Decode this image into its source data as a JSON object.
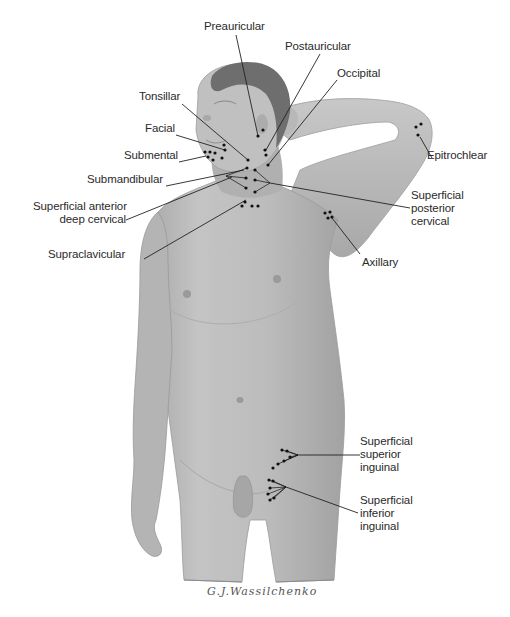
{
  "figure": {
    "signature": "G.J.Wassilchenko",
    "colors": {
      "skin": "#bdbdbd",
      "skin_shadow": "#9a9a9a",
      "hair": "#6e6e6e",
      "leader": "#222222",
      "node": "#111111",
      "background": "#ffffff"
    }
  },
  "labels": [
    {
      "id": "preauricular",
      "text": "Preauricular",
      "x": 204,
      "y": 27
    },
    {
      "id": "postauricular",
      "text": "Postauricular",
      "x": 285,
      "y": 46
    },
    {
      "id": "occipital",
      "text": "Occipital",
      "x": 337,
      "y": 73
    },
    {
      "id": "tonsillar",
      "text": "Tonsillar",
      "x": 139,
      "y": 96
    },
    {
      "id": "facial",
      "text": "Facial",
      "x": 145,
      "y": 128
    },
    {
      "id": "submental",
      "text": "Submental",
      "x": 124,
      "y": 155
    },
    {
      "id": "submandibular",
      "text": "Submandibular",
      "x": 87,
      "y": 179
    },
    {
      "id": "superficial-anterior-deep-cervical",
      "line1": "Superficial anterior",
      "line2": "deep cervical",
      "x": 33,
      "y": 207
    },
    {
      "id": "supraclavicular",
      "text": "Supraclavicular",
      "x": 48,
      "y": 254
    },
    {
      "id": "epitrochlear",
      "text": "Epitrochlear",
      "x": 427,
      "y": 155
    },
    {
      "id": "superficial-posterior-cervical",
      "line1": "Superficial",
      "line2": "posterior",
      "line3": "cervical",
      "x": 411,
      "y": 189
    },
    {
      "id": "axillary",
      "text": "Axillary",
      "x": 362,
      "y": 254
    },
    {
      "id": "superficial-superior-inguinal",
      "line1": "Superficial",
      "line2": "superior",
      "line3": "inguinal",
      "x": 360,
      "y": 436
    },
    {
      "id": "superficial-inferior-inguinal",
      "line1": "Superficial",
      "line2": "inferior",
      "line3": "inguinal",
      "x": 360,
      "y": 494
    }
  ]
}
